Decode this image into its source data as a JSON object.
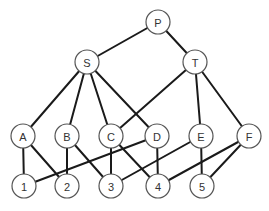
{
  "diagram": {
    "type": "graph",
    "nodes": [
      {
        "id": "P",
        "label": "P",
        "level": 0
      },
      {
        "id": "S",
        "label": "S",
        "level": 1
      },
      {
        "id": "T",
        "label": "T",
        "level": 1
      },
      {
        "id": "A",
        "label": "A",
        "level": 2
      },
      {
        "id": "B",
        "label": "B",
        "level": 2
      },
      {
        "id": "C",
        "label": "C",
        "level": 2
      },
      {
        "id": "D",
        "label": "D",
        "level": 2
      },
      {
        "id": "E",
        "label": "E",
        "level": 2
      },
      {
        "id": "F",
        "label": "F",
        "level": 2
      },
      {
        "id": "1",
        "label": "1",
        "level": 3
      },
      {
        "id": "2",
        "label": "2",
        "level": 3
      },
      {
        "id": "3",
        "label": "3",
        "level": 3
      },
      {
        "id": "4",
        "label": "4",
        "level": 3
      },
      {
        "id": "5",
        "label": "5",
        "level": 3
      }
    ],
    "edges": [
      [
        "P",
        "S"
      ],
      [
        "P",
        "T"
      ],
      [
        "S",
        "A"
      ],
      [
        "S",
        "B"
      ],
      [
        "S",
        "C"
      ],
      [
        "S",
        "D"
      ],
      [
        "T",
        "C"
      ],
      [
        "T",
        "E"
      ],
      [
        "T",
        "F"
      ],
      [
        "A",
        "1"
      ],
      [
        "A",
        "2"
      ],
      [
        "B",
        "2"
      ],
      [
        "B",
        "3"
      ],
      [
        "C",
        "3"
      ],
      [
        "C",
        "4"
      ],
      [
        "D",
        "1"
      ],
      [
        "D",
        "4"
      ],
      [
        "E",
        "3"
      ],
      [
        "E",
        "5"
      ],
      [
        "F",
        "4"
      ],
      [
        "F",
        "5"
      ]
    ]
  }
}
